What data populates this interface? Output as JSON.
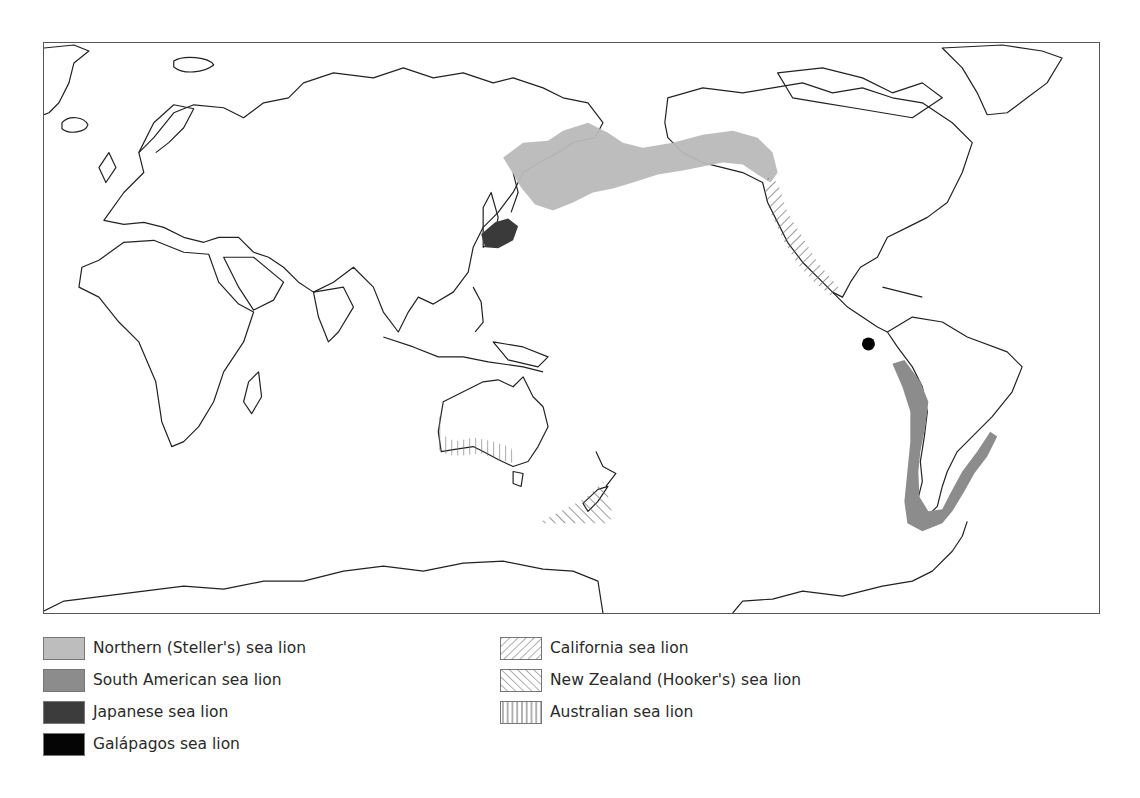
{
  "map": {
    "title": "Sea lion species distribution",
    "colors": {
      "northern_steller": "#b9b9b9",
      "south_american": "#8c8c8c",
      "japanese": "#3a3a3a",
      "galapagos": "#000000",
      "hatch": "#6e6e6e",
      "coastline": "#222222"
    },
    "ranges": [
      {
        "species": "Northern (Steller's) sea lion",
        "region": "North Pacific rim: Sea of Okhotsk, Bering Sea, Aleutians, Gulf of Alaska to northern California",
        "style": "light-gray-fill"
      },
      {
        "species": "South American sea lion",
        "region": "Coasts of South America from Peru around Cape Horn to southern Brazil",
        "style": "medium-gray-fill"
      },
      {
        "species": "Japanese sea lion",
        "region": "Sea of Japan / around Japan",
        "style": "dark-gray-fill"
      },
      {
        "species": "Galápagos sea lion",
        "region": "Galápagos Islands",
        "style": "black-dot"
      },
      {
        "species": "California sea lion",
        "region": "West coast of North America, British Columbia to Mexico",
        "style": "diagonal-hatch-forward"
      },
      {
        "species": "New Zealand (Hooker's) sea lion",
        "region": "Southern New Zealand and subantarctic islands",
        "style": "diagonal-hatch-back"
      },
      {
        "species": "Australian sea lion",
        "region": "Southern and western Australian coast",
        "style": "vertical-hatch"
      }
    ]
  },
  "legend": {
    "left": [
      {
        "label": "Northern (Steller's) sea lion",
        "swatch": "light-gray"
      },
      {
        "label": "South American sea lion",
        "swatch": "medium-gray"
      },
      {
        "label": "Japanese sea lion",
        "swatch": "dark-gray"
      },
      {
        "label": "Galápagos sea lion",
        "swatch": "black"
      }
    ],
    "right": [
      {
        "label": "California sea lion",
        "swatch": "forward-diagonal-hatch"
      },
      {
        "label": "New Zealand (Hooker's) sea lion",
        "swatch": "backward-diagonal-hatch"
      },
      {
        "label": "Australian sea lion",
        "swatch": "vertical-hatch"
      }
    ]
  }
}
